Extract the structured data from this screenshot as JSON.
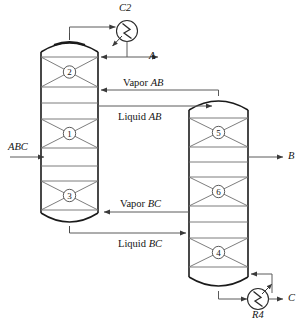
{
  "diagram": {
    "type": "process-flow-diagram",
    "colors": {
      "vessel_outline": "#1a1a1a",
      "internal_line": "#6e6e6e",
      "stream_line": "#5a5a5a",
      "label_text": "#141414",
      "background": "#ffffff"
    }
  },
  "columns": {
    "prefractionator": {
      "name": "left-column",
      "sections": [
        {
          "id": "sec-2",
          "label": "2"
        },
        {
          "id": "sec-1",
          "label": "1"
        },
        {
          "id": "sec-3",
          "label": "3"
        }
      ]
    },
    "main_column": {
      "name": "right-column",
      "sections": [
        {
          "id": "sec-5",
          "label": "5"
        },
        {
          "id": "sec-6",
          "label": "6"
        },
        {
          "id": "sec-4",
          "label": "4"
        }
      ]
    }
  },
  "equipment": [
    {
      "id": "condenser",
      "label": "C2",
      "kind": "heat-exchanger"
    },
    {
      "id": "reboiler",
      "label": "R4",
      "kind": "heat-exchanger"
    }
  ],
  "streams": {
    "feed": {
      "label": "ABC",
      "italic": true
    },
    "distillate": {
      "label": "A",
      "italic": true
    },
    "sidedraw": {
      "label": "B",
      "italic": true
    },
    "bottoms": {
      "label": "C",
      "italic": true
    },
    "vapor_ab": {
      "word": "Vapor",
      "species": "AB"
    },
    "liquid_ab": {
      "word": "Liquid",
      "species": "AB"
    },
    "vapor_bc": {
      "word": "Vapor",
      "species": "BC"
    },
    "liquid_bc": {
      "word": "Liquid",
      "species": "BC"
    }
  }
}
